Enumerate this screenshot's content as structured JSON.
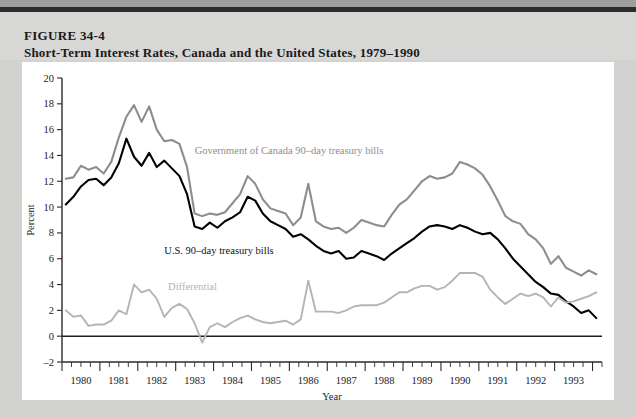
{
  "header": {
    "figure_number": "FIGURE 34-4",
    "title": "Short-Term Interest Rates, Canada and the United States, 1979–1990"
  },
  "caption": {
    "text": "Canadian short-term interest rates have generally exceeded"
  },
  "chart_data": {
    "type": "line",
    "title": "Short-Term Interest Rates, Canada and the United States, 1979–1990",
    "xlabel": "Year",
    "ylabel": "Percent",
    "ylim": [
      -2,
      20
    ],
    "ytick_step": 2,
    "yticks": [
      -2,
      0,
      2,
      4,
      6,
      8,
      10,
      12,
      14,
      16,
      18,
      20
    ],
    "xlim": [
      1979.5,
      1993.75
    ],
    "xticks": [
      1980,
      1981,
      1982,
      1983,
      1984,
      1985,
      1986,
      1987,
      1988,
      1989,
      1990,
      1991,
      1992,
      1993
    ],
    "xtick_labels": [
      "1980",
      "1981",
      "1982",
      "1983",
      "1984",
      "1985",
      "1986",
      "1987",
      "1988",
      "1989",
      "1990",
      "1991",
      "1992",
      "1993"
    ],
    "minor_ticks_per_year": 4,
    "grid": false,
    "legend": "inline-labels",
    "zero_line": true,
    "colors": {
      "canada": "#8d8d8d",
      "us": "#000000",
      "differential": "#b4b4b4",
      "axis": "#2b2b2b",
      "panel_background": "#ffffff",
      "page_background": "#d2d2d0",
      "header_background": "#d7d7d5"
    },
    "annotations": [
      {
        "id": "label-canada",
        "text": "Government of Canada 90–day treasury bills",
        "x": 1983.0,
        "y": 14.1,
        "color": "#8d8d8d"
      },
      {
        "id": "label-us",
        "text": "U.S. 90–day treasury bills",
        "x": 1982.2,
        "y": 6.4,
        "color": "#111111"
      },
      {
        "id": "label-differential",
        "text": "Differential",
        "x": 1982.3,
        "y": 3.6,
        "color": "#b4b4b4"
      }
    ],
    "x": [
      1979.6,
      1979.8,
      1980.0,
      1980.2,
      1980.4,
      1980.6,
      1980.8,
      1981.0,
      1981.2,
      1981.4,
      1981.6,
      1981.8,
      1982.0,
      1982.2,
      1982.4,
      1982.6,
      1982.8,
      1983.0,
      1983.2,
      1983.4,
      1983.6,
      1983.8,
      1984.0,
      1984.2,
      1984.4,
      1984.6,
      1984.8,
      1985.0,
      1985.2,
      1985.4,
      1985.6,
      1985.8,
      1986.0,
      1986.2,
      1986.4,
      1986.6,
      1986.8,
      1987.0,
      1987.2,
      1987.4,
      1987.6,
      1987.8,
      1988.0,
      1988.2,
      1988.4,
      1988.6,
      1988.8,
      1989.0,
      1989.2,
      1989.4,
      1989.6,
      1989.8,
      1990.0,
      1990.2,
      1990.4,
      1990.6,
      1990.8,
      1991.0,
      1991.2,
      1991.4,
      1991.6,
      1991.8,
      1992.0,
      1992.2,
      1992.4,
      1992.6,
      1992.8,
      1993.0,
      1993.2,
      1993.4,
      1993.6
    ],
    "series": [
      {
        "name": "Government of Canada 90-day treasury bills",
        "color": "#8d8d8d",
        "values": [
          12.2,
          12.3,
          13.2,
          12.9,
          13.1,
          12.6,
          13.5,
          15.4,
          17.0,
          17.9,
          16.6,
          17.8,
          16.0,
          15.1,
          15.2,
          14.9,
          13.1,
          9.5,
          9.3,
          9.5,
          9.4,
          9.6,
          10.3,
          11.0,
          12.4,
          11.8,
          10.6,
          9.9,
          9.7,
          9.5,
          8.6,
          9.2,
          11.8,
          8.9,
          8.5,
          8.3,
          8.4,
          8.0,
          8.4,
          9.0,
          8.8,
          8.6,
          8.5,
          9.4,
          10.2,
          10.6,
          11.3,
          12.0,
          12.4,
          12.2,
          12.3,
          12.6,
          13.5,
          13.3,
          13.0,
          12.5,
          11.6,
          10.5,
          9.3,
          8.9,
          8.7,
          7.9,
          7.5,
          6.8,
          5.6,
          6.2,
          5.3,
          5.0,
          4.7,
          5.1,
          4.8
        ]
      },
      {
        "name": "U.S. 90-day treasury bills",
        "color": "#000000",
        "values": [
          10.2,
          10.8,
          11.6,
          12.1,
          12.2,
          11.7,
          12.3,
          13.4,
          15.3,
          13.9,
          13.2,
          14.2,
          13.1,
          13.6,
          13.0,
          12.4,
          11.0,
          8.5,
          8.3,
          8.8,
          8.4,
          8.9,
          9.2,
          9.6,
          10.8,
          10.5,
          9.5,
          8.9,
          8.6,
          8.3,
          7.7,
          7.9,
          7.5,
          7.0,
          6.6,
          6.4,
          6.6,
          6.0,
          6.1,
          6.6,
          6.4,
          6.2,
          5.9,
          6.4,
          6.8,
          7.2,
          7.6,
          8.1,
          8.5,
          8.6,
          8.5,
          8.3,
          8.6,
          8.4,
          8.1,
          7.9,
          8.0,
          7.5,
          6.8,
          6.0,
          5.4,
          4.8,
          4.2,
          3.8,
          3.3,
          3.2,
          2.7,
          2.3,
          1.8,
          2.0,
          1.4
        ]
      },
      {
        "name": "Differential",
        "color": "#b4b4b4",
        "values": [
          2.0,
          1.5,
          1.6,
          0.8,
          0.9,
          0.9,
          1.2,
          2.0,
          1.7,
          4.0,
          3.4,
          3.6,
          2.9,
          1.5,
          2.2,
          2.5,
          2.1,
          1.0,
          -0.5,
          0.7,
          1.0,
          0.7,
          1.1,
          1.4,
          1.6,
          1.3,
          1.1,
          1.0,
          1.1,
          1.2,
          0.9,
          1.3,
          4.3,
          1.9,
          1.9,
          1.9,
          1.8,
          2.0,
          2.3,
          2.4,
          2.4,
          2.4,
          2.6,
          3.0,
          3.4,
          3.4,
          3.7,
          3.9,
          3.9,
          3.6,
          3.8,
          4.3,
          4.9,
          4.9,
          4.9,
          4.6,
          3.6,
          3.0,
          2.5,
          2.9,
          3.3,
          3.1,
          3.3,
          3.0,
          2.3,
          3.0,
          2.6,
          2.7,
          2.9,
          3.1,
          3.4
        ]
      }
    ]
  }
}
